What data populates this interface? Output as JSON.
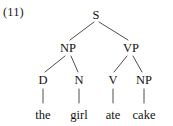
{
  "figure": {
    "example_number": "(11)",
    "type": "syntax-tree",
    "sentence": "the girl ate cake"
  },
  "tree": {
    "root": {
      "label": "S",
      "x": 96,
      "y": 15
    },
    "level2": [
      {
        "label": "NP",
        "x": 68,
        "y": 48
      },
      {
        "label": "VP",
        "x": 131,
        "y": 48
      }
    ],
    "level3": [
      {
        "label": "D",
        "x": 43,
        "y": 80
      },
      {
        "label": "N",
        "x": 79,
        "y": 80
      },
      {
        "label": "V",
        "x": 113,
        "y": 80
      },
      {
        "label": "NP",
        "x": 144,
        "y": 80
      }
    ],
    "terminals": [
      {
        "label": "the",
        "x": 43,
        "y": 115
      },
      {
        "label": "girl",
        "x": 79,
        "y": 115
      },
      {
        "label": "ate",
        "x": 113,
        "y": 115
      },
      {
        "label": "cake",
        "x": 144,
        "y": 115
      }
    ]
  },
  "edges": [
    {
      "name": "s-to-np",
      "x1": 94,
      "y1": 22,
      "x2": 70,
      "y2": 40
    },
    {
      "name": "s-to-vp",
      "x1": 99,
      "y1": 22,
      "x2": 128,
      "y2": 40
    },
    {
      "name": "np-to-d",
      "x1": 65,
      "y1": 56,
      "x2": 45,
      "y2": 72
    },
    {
      "name": "np-to-n",
      "x1": 71,
      "y1": 56,
      "x2": 78,
      "y2": 72
    },
    {
      "name": "vp-to-v",
      "x1": 127,
      "y1": 56,
      "x2": 114,
      "y2": 72
    },
    {
      "name": "vp-to-np",
      "x1": 133,
      "y1": 56,
      "x2": 142,
      "y2": 72
    },
    {
      "name": "d-to-the",
      "x1": 43,
      "y1": 89,
      "x2": 43,
      "y2": 103
    },
    {
      "name": "n-to-girl",
      "x1": 79,
      "y1": 89,
      "x2": 79,
      "y2": 103
    },
    {
      "name": "v-to-ate",
      "x1": 113,
      "y1": 89,
      "x2": 113,
      "y2": 103
    },
    {
      "name": "np-to-cake",
      "x1": 144,
      "y1": 89,
      "x2": 144,
      "y2": 103
    }
  ],
  "style": {
    "background": "#ffffff",
    "text_color": "#1a1a1a",
    "line_color": "#3a3a3a"
  }
}
